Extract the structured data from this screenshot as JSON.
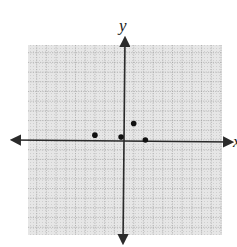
{
  "chart_data": {
    "type": "scatter",
    "title": "",
    "xlabel": "x",
    "ylabel": "y",
    "xlim": [
      -10,
      10
    ],
    "ylim": [
      -10,
      10
    ],
    "grid": true,
    "tick_labels": false,
    "points": [
      {
        "x": -3,
        "y": 0.5
      },
      {
        "x": -0.3,
        "y": 0.3
      },
      {
        "x": 1,
        "y": 1.7
      },
      {
        "x": 2.2,
        "y": 0
      }
    ]
  },
  "colors": {
    "grid_background": "#e4e4e4",
    "grid_line": "#9a9a9a",
    "axis": "#2a2a2a",
    "point": "#111111"
  },
  "layout": {
    "plot_left": 28,
    "plot_right": 222,
    "plot_top": 45,
    "plot_bottom": 235,
    "origin_x": 124,
    "origin_y": 140,
    "unit_px": 9.7
  }
}
